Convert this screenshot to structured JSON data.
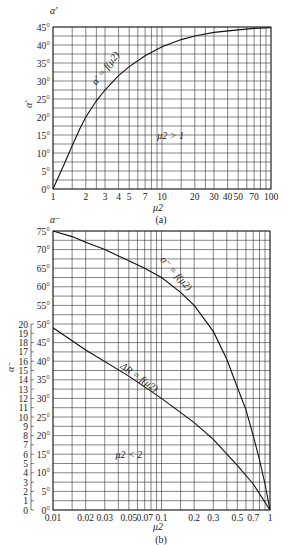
{
  "chart_data": [
    {
      "id": "a",
      "type": "line",
      "caption": "(a)",
      "title": "",
      "xlabel": "μ2",
      "ylabel": "α'",
      "y_axis_top_label": "α'",
      "xscale": "log",
      "xlim": [
        1,
        100
      ],
      "ylim": [
        0,
        45
      ],
      "grid": true,
      "x_tick_labels": [
        "1",
        "2",
        "3",
        "4",
        "5",
        "7",
        "10",
        "20",
        "30",
        "40",
        "50",
        "70",
        "100"
      ],
      "x_ticks": [
        1,
        2,
        3,
        4,
        5,
        7,
        10,
        20,
        30,
        40,
        50,
        70,
        100
      ],
      "x_grid": [
        1,
        1.5,
        2,
        2.5,
        3,
        4,
        5,
        6,
        7,
        8,
        9,
        10,
        15,
        20,
        25,
        30,
        40,
        50,
        60,
        70,
        80,
        90,
        100
      ],
      "y_tick_labels": [
        "0°",
        "5°",
        "10°",
        "15°",
        "20°",
        "25°",
        "30°",
        "35°",
        "40°",
        "45°"
      ],
      "y_ticks": [
        0,
        5,
        10,
        15,
        20,
        25,
        30,
        35,
        40,
        45
      ],
      "y_grid_step": 2.5,
      "annotations": [
        {
          "text": "α' = f(μ2)",
          "x": 3.2,
          "y": 33,
          "rotate": -52
        },
        {
          "text": "μ2 > 1",
          "x": 12,
          "y": 14,
          "rotate": 0
        }
      ],
      "series": [
        {
          "name": "α' = f(μ2)",
          "x": [
            1,
            1.25,
            1.5,
            1.75,
            2,
            2.5,
            3,
            4,
            5,
            7,
            10,
            15,
            20,
            30,
            50,
            70,
            100
          ],
          "values": [
            0,
            6.5,
            12,
            16.5,
            20,
            24.5,
            27.5,
            31.5,
            34,
            37,
            39.5,
            41.5,
            42.5,
            43.5,
            44.2,
            44.6,
            44.8
          ]
        }
      ]
    },
    {
      "id": "b",
      "type": "line",
      "caption": "(b)",
      "title": "",
      "xlabel": "μ2",
      "ylabel": "α⁻",
      "y_axis_top_label": "α⁻",
      "xscale": "log",
      "xlim": [
        0.01,
        1
      ],
      "ylim": [
        0,
        75
      ],
      "grid": true,
      "x_tick_labels": [
        "0.01",
        "0.02",
        "0.03",
        "0.05",
        "0.07",
        "0.1",
        "0.2",
        "0.3",
        "0.5",
        "0.7",
        "1"
      ],
      "x_ticks": [
        0.01,
        0.02,
        0.03,
        0.05,
        0.07,
        0.1,
        0.2,
        0.3,
        0.5,
        0.7,
        1
      ],
      "x_grid": [
        0.01,
        0.015,
        0.02,
        0.03,
        0.04,
        0.05,
        0.06,
        0.07,
        0.08,
        0.09,
        0.1,
        0.15,
        0.2,
        0.3,
        0.4,
        0.5,
        0.6,
        0.7,
        0.8,
        0.9,
        1
      ],
      "y_tick_labels": [
        "0°",
        "5°",
        "10°",
        "15°",
        "20°",
        "25°",
        "30°",
        "35°",
        "40°",
        "45°",
        "50°",
        "55°",
        "60°",
        "65°",
        "70°",
        "75°"
      ],
      "y_ticks": [
        0,
        5,
        10,
        15,
        20,
        25,
        30,
        35,
        40,
        45,
        50,
        55,
        60,
        65,
        70,
        75
      ],
      "y_grid_step": 2.5,
      "secondary_y": {
        "label": "ΔR",
        "tick_labels": [
          "0",
          "1",
          "2",
          "3",
          "4",
          "5",
          "6",
          "7",
          "8",
          "9",
          "10",
          "11",
          "12",
          "13",
          "14",
          "15",
          "16",
          "17",
          "18",
          "19",
          "20"
        ],
        "range": [
          0,
          20
        ],
        "maps_to_primary": [
          0,
          50
        ]
      },
      "annotations": [
        {
          "text": "α⁻ = f(μ2)",
          "x": 0.13,
          "y": 63,
          "rotate": 48
        },
        {
          "text": "ΔR = f(μ2)",
          "x": 0.06,
          "y": 35,
          "rotate": 35
        },
        {
          "text": "μ2 < 2",
          "x": 0.05,
          "y": 14,
          "rotate": 0
        }
      ],
      "series": [
        {
          "name": "α⁻ = f(μ2)",
          "x": [
            0.01,
            0.015,
            0.02,
            0.03,
            0.05,
            0.07,
            0.1,
            0.15,
            0.2,
            0.3,
            0.4,
            0.5,
            0.6,
            0.7,
            0.8,
            0.9,
            1
          ],
          "values": [
            75,
            73.5,
            72,
            70,
            67,
            65,
            62.5,
            58.5,
            55,
            48,
            40.5,
            33,
            27,
            20,
            13.5,
            7,
            0
          ]
        },
        {
          "name": "ΔR = f(μ2)",
          "axis": "secondary",
          "x": [
            0.01,
            0.02,
            0.05,
            0.1,
            0.2,
            0.3,
            0.5,
            0.7,
            1
          ],
          "values": [
            19.6,
            17.2,
            14.4,
            12.0,
            9.4,
            7.6,
            4.8,
            2.8,
            0
          ],
          "values_in_primary_degrees": [
            49,
            43,
            36,
            30,
            23.5,
            19,
            12,
            7,
            0
          ]
        }
      ]
    }
  ]
}
